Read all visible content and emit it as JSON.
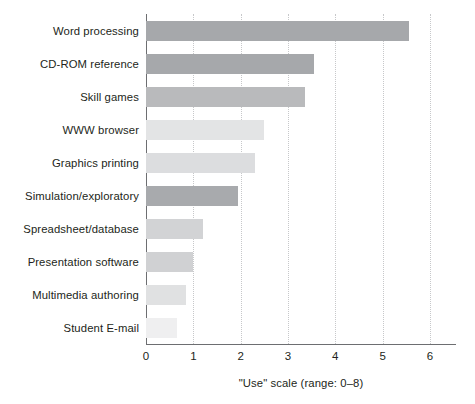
{
  "chart_data": {
    "type": "bar",
    "orientation": "horizontal",
    "title": "",
    "xlabel": "\"Use\" scale (range: 0–8)",
    "ylabel": "",
    "xlim": [
      0,
      6.55
    ],
    "xticks": [
      0,
      1,
      2,
      3,
      4,
      5,
      6
    ],
    "xtick_labels": [
      "0",
      "1",
      "2",
      "3",
      "4",
      "5",
      "6"
    ],
    "grid": "vertical-dotted",
    "legend": "none",
    "categories": [
      "Word processing",
      "CD-ROM reference",
      "Skill games",
      "WWW browser",
      "Graphics printing",
      "Simulation/exploratory",
      "Spreadsheet/database",
      "Presentation software",
      "Multimedia authoring",
      "Student E-mail"
    ],
    "values": [
      5.55,
      3.55,
      3.35,
      2.5,
      2.3,
      1.95,
      1.2,
      1.0,
      0.85,
      0.65
    ],
    "bar_colors": [
      "#a6a8ab",
      "#a6a8ab",
      "#b9babc",
      "#e3e4e5",
      "#dcdddf",
      "#a8aaad",
      "#d2d3d5",
      "#d0d1d3",
      "#e0e1e2",
      "#efeff0"
    ]
  },
  "axis": {
    "line_color": "#6d6e71",
    "grid_color": "#c7c8ca"
  }
}
